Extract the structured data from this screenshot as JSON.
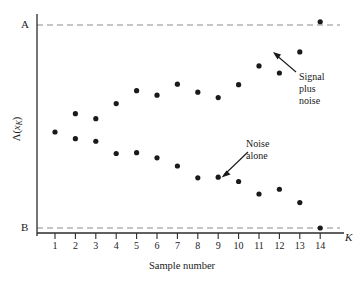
{
  "chart_data": {
    "type": "scatter",
    "title": "",
    "xlabel": "Sample number",
    "ylabel": "Λ(xₖ)",
    "ylabel_parts": {
      "fn": "Λ(",
      "var": "x",
      "sub": "K",
      "close": ")"
    },
    "xlim": [
      0,
      15
    ],
    "ylim": [
      0,
      1
    ],
    "grid": false,
    "legend_position": "inline-annotations",
    "x_axis_end_label": "K",
    "categories": [
      1,
      2,
      3,
      4,
      5,
      6,
      7,
      8,
      9,
      10,
      11,
      12,
      13,
      14
    ],
    "xtick_labels": [
      "1",
      "2",
      "3",
      "4",
      "5",
      "6",
      "7",
      "8",
      "9",
      "10",
      "11",
      "12",
      "13",
      "14"
    ],
    "thresholds": [
      {
        "name": "A",
        "label": "A",
        "value": 0.965,
        "style": "dashed"
      },
      {
        "name": "B",
        "label": "B",
        "value": 0.022,
        "style": "dashed"
      }
    ],
    "series": [
      {
        "name": "Signal plus noise",
        "marker": "filled-circle",
        "color": "#1a1a1a",
        "x": [
          1,
          2,
          3,
          4,
          5,
          6,
          7,
          8,
          9,
          10,
          11,
          12,
          13,
          14
        ],
        "values": [
          0.468,
          0.553,
          0.53,
          0.6,
          0.66,
          0.639,
          0.69,
          0.653,
          0.628,
          0.688,
          0.775,
          0.742,
          0.84,
          0.98
        ]
      },
      {
        "name": "Noise alone",
        "marker": "filled-circle",
        "color": "#1a1a1a",
        "x": [
          2,
          3,
          4,
          5,
          6,
          7,
          8,
          9,
          10,
          11,
          12,
          13,
          14
        ],
        "values": [
          0.437,
          0.425,
          0.368,
          0.372,
          0.348,
          0.31,
          0.255,
          0.258,
          0.238,
          0.18,
          0.202,
          0.14,
          0.022
        ]
      }
    ],
    "annotations": [
      {
        "name": "signal-plus-noise",
        "text": "Signal\nplus\nnoise",
        "lines": [
          "Signal",
          "plus",
          "noise"
        ],
        "points_to": {
          "x": 12,
          "series": "Signal plus noise"
        }
      },
      {
        "name": "noise-alone",
        "text": "Noise\nalone",
        "lines": [
          "Noise",
          "alone"
        ],
        "points_to": {
          "x": 9,
          "series": "Noise alone"
        }
      }
    ]
  },
  "labels": {
    "threshold_a": "A",
    "threshold_b": "B",
    "axis_end": "K",
    "x_axis_title": "Sample number",
    "y_axis_fn": "Λ(",
    "y_axis_var": "x",
    "y_axis_sub": "K",
    "y_axis_close": ")"
  },
  "annotations": {
    "signal_plus_noise": "Signal\nplus\nnoise",
    "noise_alone": "Noise\nalone"
  },
  "colors": {
    "marker": "#1a1a1a",
    "axis": "#2b2b2b",
    "threshold_line": "#8c8c8c",
    "background": "#ffffff"
  }
}
